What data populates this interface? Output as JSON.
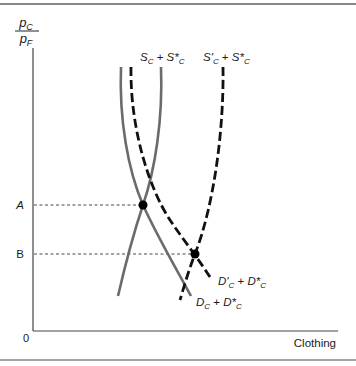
{
  "figure": {
    "y_axis_label": {
      "numerator": "p",
      "numerator_sub": "C",
      "denominator": "p",
      "denominator_sub": "F"
    },
    "x_axis_label": "Clothing",
    "origin_label": "0",
    "price_levels": [
      {
        "label": "A",
        "italic": true
      },
      {
        "label": "B",
        "italic": false
      }
    ],
    "curves": [
      {
        "id": "supply-original",
        "label_parts": [
          [
            "S",
            "C"
          ],
          [
            " + ",
            ""
          ],
          [
            "S*",
            "C"
          ]
        ],
        "style": "solid",
        "color": "#6b6b6b"
      },
      {
        "id": "supply-shifted",
        "label_parts": [
          [
            "S'",
            "C"
          ],
          [
            " + ",
            ""
          ],
          [
            "S*",
            "C"
          ]
        ],
        "style": "dashed",
        "color": "#111111"
      },
      {
        "id": "demand-original",
        "label_parts": [
          [
            "D",
            "C"
          ],
          [
            " + ",
            ""
          ],
          [
            "D*",
            "C"
          ]
        ],
        "style": "solid",
        "color": "#6b6b6b"
      },
      {
        "id": "demand-shifted",
        "label_parts": [
          [
            "D'",
            "C"
          ],
          [
            " + ",
            ""
          ],
          [
            "D*",
            "C"
          ]
        ],
        "style": "dashed",
        "color": "#111111"
      }
    ],
    "equilibria": [
      {
        "level": "A",
        "curves": [
          "supply-original",
          "demand-original"
        ]
      },
      {
        "level": "B",
        "curves": [
          "supply-shifted",
          "demand-shifted"
        ]
      }
    ]
  }
}
